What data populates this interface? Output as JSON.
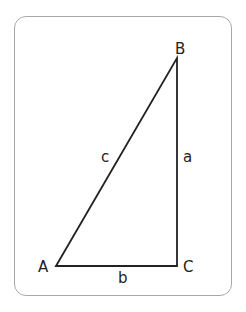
{
  "diagram": {
    "type": "right-triangle",
    "vertices": {
      "A": {
        "label": "A",
        "x": 56,
        "y": 266
      },
      "B": {
        "label": "B",
        "x": 177,
        "y": 58
      },
      "C": {
        "label": "C",
        "x": 177,
        "y": 266
      }
    },
    "sides": {
      "a": {
        "label": "a",
        "from": "B",
        "to": "C"
      },
      "b": {
        "label": "b",
        "from": "A",
        "to": "C"
      },
      "c": {
        "label": "c",
        "from": "A",
        "to": "B"
      }
    },
    "colors": {
      "stroke": "#222222",
      "border": "#a8a8a8",
      "background": "#ffffff"
    }
  }
}
